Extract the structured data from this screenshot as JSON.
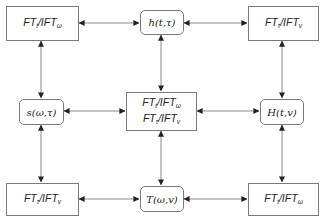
{
  "diagram": {
    "type": "transform-relationship-grid",
    "colors": {
      "stroke": "#7a7a7a",
      "arrow": "#222222",
      "text": "#222222",
      "background": "#ffffff"
    },
    "nodes": {
      "top_left": {
        "shape": "rect",
        "lines": [
          {
            "main": "FT",
            "sub1": "t",
            "mid": "/IFT",
            "sub2": "ω"
          }
        ]
      },
      "top_center": {
        "shape": "round",
        "text": "h(t,τ)"
      },
      "top_right": {
        "shape": "rect",
        "lines": [
          {
            "main": "FT",
            "sub1": "τ",
            "mid": "/IFT",
            "sub2": "v"
          }
        ]
      },
      "mid_left": {
        "shape": "round",
        "text": "s(ω,τ)"
      },
      "center": {
        "shape": "rect",
        "lines": [
          {
            "main": "FT",
            "sub1": "t",
            "mid": "/IFT",
            "sub2": "ω"
          },
          {
            "main": "FT",
            "sub1": "τ",
            "mid": "/IFT",
            "sub2": "v"
          }
        ]
      },
      "mid_right": {
        "shape": "round",
        "text": "H(t,v)"
      },
      "bottom_left": {
        "shape": "rect",
        "lines": [
          {
            "main": "FT",
            "sub1": "τ",
            "mid": "/IFT",
            "sub2": "v"
          }
        ]
      },
      "bottom_center": {
        "shape": "round",
        "text": "T(ω,v)"
      },
      "bottom_right": {
        "shape": "rect",
        "lines": [
          {
            "main": "FT",
            "sub1": "t",
            "mid": "/IFT",
            "sub2": "ω"
          }
        ]
      }
    },
    "edges": [
      {
        "from": "top_left",
        "to": "top_center",
        "bidirectional": true
      },
      {
        "from": "top_center",
        "to": "top_right",
        "bidirectional": true
      },
      {
        "from": "top_left",
        "to": "mid_left",
        "bidirectional": true
      },
      {
        "from": "top_center",
        "to": "center",
        "bidirectional": true
      },
      {
        "from": "top_right",
        "to": "mid_right",
        "bidirectional": true
      },
      {
        "from": "mid_left",
        "to": "center",
        "bidirectional": true
      },
      {
        "from": "center",
        "to": "mid_right",
        "bidirectional": true
      },
      {
        "from": "mid_left",
        "to": "bottom_left",
        "bidirectional": true
      },
      {
        "from": "center",
        "to": "bottom_center",
        "bidirectional": true
      },
      {
        "from": "mid_right",
        "to": "bottom_right",
        "bidirectional": true
      },
      {
        "from": "bottom_left",
        "to": "bottom_center",
        "bidirectional": true
      },
      {
        "from": "bottom_center",
        "to": "bottom_right",
        "bidirectional": true
      }
    ]
  }
}
